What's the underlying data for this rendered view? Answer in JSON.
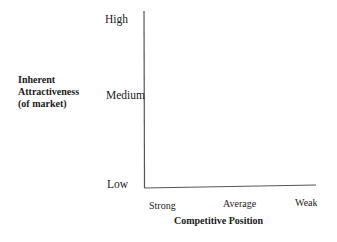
{
  "diagram": {
    "type": "matrix-axes",
    "y_axis": {
      "label_lines": [
        "Inherent",
        "Attractiveness",
        "(of market)"
      ],
      "ticks": [
        "High",
        "Medium",
        "Low"
      ]
    },
    "x_axis": {
      "label": "Competitive Position",
      "ticks": [
        "Strong",
        "Average",
        "Weak"
      ]
    },
    "line_color": "#555555"
  }
}
